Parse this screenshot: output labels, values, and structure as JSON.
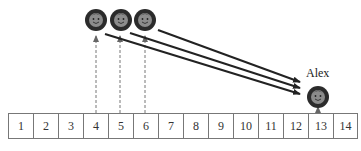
{
  "diagram": {
    "cells": [
      "1",
      "2",
      "3",
      "4",
      "5",
      "6",
      "7",
      "8",
      "9",
      "10",
      "11",
      "12",
      "13",
      "14"
    ],
    "people": [
      {
        "name": "person-1",
        "cx": 96,
        "cy": 20,
        "cell": "4"
      },
      {
        "name": "person-2",
        "cx": 121,
        "cy": 20,
        "cell": "5"
      },
      {
        "name": "person-3",
        "cx": 145,
        "cy": 20,
        "cell": "6"
      }
    ],
    "target": {
      "label": "Alex",
      "cx": 318,
      "cy": 97,
      "cell": "13"
    },
    "arrows_to_target": [
      {
        "from": [
          105,
          34
        ],
        "to": [
          301,
          94
        ]
      },
      {
        "from": [
          130,
          33
        ],
        "to": [
          301,
          88
        ]
      },
      {
        "from": [
          158,
          30
        ],
        "to": [
          301,
          82
        ]
      }
    ],
    "colors": {
      "face_ring": "#2b2b2b",
      "face": "#8a8a8a",
      "line": "#222222",
      "dashed": "#777777"
    },
    "caption": ""
  }
}
